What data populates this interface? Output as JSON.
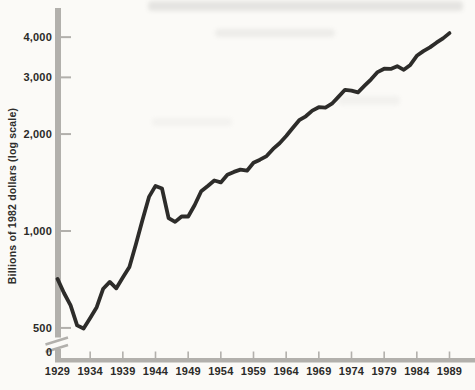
{
  "figure": {
    "colors": {
      "background": "#fbfaf7",
      "axis": "#b2b0ac",
      "tick": "#b2b0ac",
      "line": "#2d2c2a",
      "label": "#2b2a28"
    }
  },
  "chart_data": {
    "type": "line",
    "title": "",
    "xlabel": "",
    "ylabel": "Billions of 1982 dollars (log scale)",
    "y_scale": "log",
    "grid": false,
    "legend": false,
    "axis_break_above_zero": true,
    "y_origin_label": "0",
    "y_tick_labels": [
      "4,000",
      "3,000",
      "2,000",
      "1,000",
      "500"
    ],
    "y_tick_values": [
      4000,
      3000,
      2000,
      1000,
      500
    ],
    "x_tick_labels": [
      "1929",
      "1934",
      "1939",
      "1944",
      "1949",
      "1954",
      "1959",
      "1964",
      "1969",
      "1974",
      "1979",
      "1984",
      "1989"
    ],
    "x_tick_years": [
      1929,
      1934,
      1939,
      1944,
      1949,
      1954,
      1959,
      1964,
      1969,
      1974,
      1979,
      1984,
      1989
    ],
    "xlim": [
      1929,
      1989
    ],
    "ylim": [
      500,
      4000
    ],
    "series": [
      {
        "name": "Real GNP",
        "x": [
          1929,
          1930,
          1931,
          1932,
          1933,
          1934,
          1935,
          1936,
          1937,
          1938,
          1939,
          1940,
          1941,
          1942,
          1943,
          1944,
          1945,
          1946,
          1947,
          1948,
          1949,
          1950,
          1951,
          1952,
          1953,
          1954,
          1955,
          1956,
          1957,
          1958,
          1959,
          1960,
          1961,
          1962,
          1963,
          1964,
          1965,
          1966,
          1967,
          1968,
          1969,
          1970,
          1971,
          1972,
          1973,
          1974,
          1975,
          1976,
          1977,
          1978,
          1979,
          1980,
          1981,
          1982,
          1983,
          1984,
          1985,
          1986,
          1987,
          1988,
          1989
        ],
        "values": [
          710,
          642,
          588,
          509,
          498,
          537,
          580,
          662,
          695,
          664,
          717,
          773,
          909,
          1080,
          1276,
          1381,
          1355,
          1097,
          1067,
          1109,
          1109,
          1204,
          1328,
          1380,
          1435,
          1416,
          1495,
          1526,
          1551,
          1539,
          1629,
          1665,
          1709,
          1799,
          1873,
          1973,
          2088,
          2208,
          2271,
          2366,
          2423,
          2416,
          2485,
          2609,
          2744,
          2729,
          2695,
          2827,
          2959,
          3115,
          3192,
          3187,
          3249,
          3166,
          3279,
          3501,
          3619,
          3718,
          3845,
          3963,
          4118
        ]
      }
    ]
  }
}
